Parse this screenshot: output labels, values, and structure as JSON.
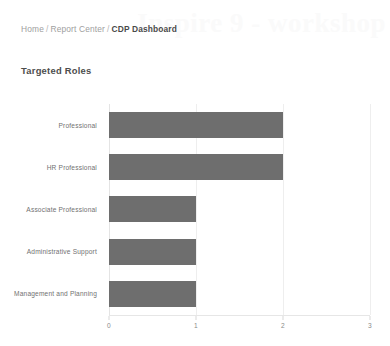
{
  "breadcrumb": {
    "separator": "/",
    "items": [
      {
        "label": "Home",
        "current": false
      },
      {
        "label": "Report Center",
        "current": false
      },
      {
        "label": "CDP Dashboard",
        "current": true
      }
    ]
  },
  "watermark": {
    "text": "Inspire 9 - workshop"
  },
  "panel": {
    "title": "Targeted Roles"
  },
  "colors": {
    "bar": "#6e6e6e",
    "gridline": "#eeeeee",
    "axis_text": "#8a8a8a",
    "category_text": "#717171",
    "title_text": "#4d4d4d",
    "breadcrumb_text": "#9b9b9b",
    "breadcrumb_current_text": "#4a4a4a",
    "background": "#ffffff"
  },
  "chart_data": {
    "type": "bar",
    "orientation": "horizontal",
    "title": "Targeted Roles",
    "xlabel": "",
    "ylabel": "",
    "categories": [
      "Professional",
      "HR Professional",
      "Associate Professional",
      "Administrative Support",
      "Management and Planning"
    ],
    "values": [
      2,
      2,
      1,
      1,
      1
    ],
    "xlim": [
      0,
      3
    ],
    "xticks": [
      0,
      1,
      2,
      3
    ],
    "xticklabels": [
      "0",
      "1",
      "2",
      "3"
    ],
    "grid": true,
    "grid_axis": "x",
    "legend": false,
    "legend_position": "none",
    "bar_color": "#6e6e6e"
  }
}
